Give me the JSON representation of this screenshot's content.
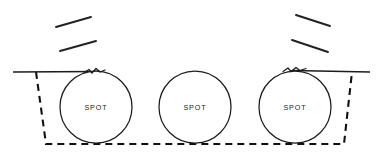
{
  "canvas": {
    "width": 379,
    "height": 156,
    "background": "#ffffff",
    "line_color": "#1c1c1c",
    "dash_color": "#111111"
  },
  "labels": {
    "spot_left": "SPOT",
    "spot_center": "SPOT",
    "spot_right": "SPOT"
  },
  "chart_data": {
    "type": "diagram",
    "title": "",
    "circles": [
      {
        "name": "spot-left",
        "label": "SPOT",
        "cx": 96,
        "cy": 107,
        "r": 36
      },
      {
        "name": "spot-center",
        "label": "SPOT",
        "cx": 195,
        "cy": 107,
        "r": 36
      },
      {
        "name": "spot-right",
        "label": "SPOT",
        "cx": 295,
        "cy": 107,
        "r": 36
      }
    ],
    "ground_lines": [
      {
        "name": "ground-left",
        "x1": 13,
        "y1": 72,
        "x2": 96,
        "y2": 72
      },
      {
        "name": "ground-right",
        "x1": 295,
        "y1": 72,
        "x2": 370,
        "y2": 72
      }
    ],
    "break_marks": [
      {
        "name": "break-left",
        "cx": 96,
        "cy": 71
      },
      {
        "name": "break-right",
        "cx": 295,
        "cy": 70
      }
    ],
    "dashed_outline": {
      "points": "36,72 46,144 344,144 352,72",
      "dash_pattern": "7 5"
    },
    "hatch_slashes": [
      {
        "name": "slash-left-upper",
        "x1": 56,
        "y1": 27,
        "x2": 91,
        "y2": 17
      },
      {
        "name": "slash-left-lower",
        "x1": 60,
        "y1": 51,
        "x2": 96,
        "y2": 41
      },
      {
        "name": "slash-right-upper",
        "x1": 296,
        "y1": 15,
        "x2": 330,
        "y2": 26
      },
      {
        "name": "slash-right-lower",
        "x1": 292,
        "y1": 40,
        "x2": 328,
        "y2": 52
      }
    ]
  }
}
